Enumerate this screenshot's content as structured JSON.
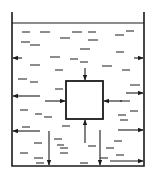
{
  "diagram": {
    "title": "Liquid pressure on a submerged cube and container walls",
    "colors": {
      "stroke": "#1a1a1a",
      "background": "#ffffff"
    },
    "container": {
      "left": 12,
      "right": 144,
      "top": 12,
      "bottom": 166
    },
    "water_surface_y": 23,
    "cube": {
      "x": 66,
      "y": 81,
      "w": 37,
      "h": 38
    },
    "arrows": [
      {
        "id": "cube-top",
        "x1": 85,
        "y1": 68,
        "x2": 85,
        "y2": 80
      },
      {
        "id": "cube-left",
        "x1": 45,
        "y1": 101,
        "x2": 65,
        "y2": 101
      },
      {
        "id": "cube-right",
        "x1": 122,
        "y1": 101,
        "x2": 104,
        "y2": 101
      },
      {
        "id": "cube-bottom",
        "x1": 85,
        "y1": 143,
        "x2": 85,
        "y2": 120
      },
      {
        "id": "left-wall-1",
        "x1": 22,
        "y1": 58,
        "x2": 13,
        "y2": 58
      },
      {
        "id": "right-wall-1",
        "x1": 134,
        "y1": 58,
        "x2": 143,
        "y2": 58
      },
      {
        "id": "left-wall-2",
        "x1": 40,
        "y1": 96,
        "x2": 13,
        "y2": 96
      },
      {
        "id": "right-wall-2",
        "x1": 126,
        "y1": 93,
        "x2": 143,
        "y2": 93
      },
      {
        "id": "left-wall-3",
        "x1": 40,
        "y1": 131,
        "x2": 13,
        "y2": 131
      },
      {
        "id": "right-wall-3",
        "x1": 118,
        "y1": 130,
        "x2": 143,
        "y2": 130
      },
      {
        "id": "right-wall-4",
        "x1": 110,
        "y1": 161,
        "x2": 143,
        "y2": 161
      },
      {
        "id": "bottom-1",
        "x1": 49,
        "y1": 131,
        "x2": 49,
        "y2": 165
      },
      {
        "id": "bottom-2",
        "x1": 100,
        "y1": 130,
        "x2": 100,
        "y2": 165
      }
    ],
    "dashes": [
      [
        22,
        32,
        30,
        32
      ],
      [
        40,
        32,
        50,
        32
      ],
      [
        72,
        32,
        82,
        32
      ],
      [
        88,
        32,
        96,
        32
      ],
      [
        115,
        35,
        124,
        35
      ],
      [
        126,
        31,
        134,
        31
      ],
      [
        21,
        42,
        30,
        42
      ],
      [
        30,
        45,
        40,
        45
      ],
      [
        60,
        38,
        70,
        38
      ],
      [
        88,
        40,
        98,
        40
      ],
      [
        80,
        49,
        90,
        49
      ],
      [
        116,
        52,
        124,
        52
      ],
      [
        50,
        57,
        60,
        57
      ],
      [
        70,
        59,
        78,
        59
      ],
      [
        80,
        62,
        88,
        62
      ],
      [
        30,
        65,
        40,
        65
      ],
      [
        55,
        70,
        63,
        70
      ],
      [
        102,
        66,
        112,
        66
      ],
      [
        122,
        70,
        130,
        70
      ],
      [
        18,
        79,
        27,
        79
      ],
      [
        30,
        82,
        38,
        82
      ],
      [
        55,
        89,
        63,
        89
      ],
      [
        130,
        85,
        140,
        85
      ],
      [
        120,
        101,
        130,
        101
      ],
      [
        20,
        110,
        28,
        110
      ],
      [
        35,
        114,
        42,
        114
      ],
      [
        44,
        117,
        52,
        117
      ],
      [
        118,
        115,
        126,
        115
      ],
      [
        130,
        111,
        138,
        111
      ],
      [
        22,
        127,
        30,
        127
      ],
      [
        62,
        126,
        70,
        126
      ],
      [
        120,
        120,
        128,
        120
      ],
      [
        34,
        143,
        42,
        143
      ],
      [
        54,
        139,
        62,
        139
      ],
      [
        57,
        145,
        64,
        145
      ],
      [
        114,
        141,
        122,
        141
      ],
      [
        34,
        158,
        43,
        158
      ],
      [
        60,
        148,
        68,
        148
      ],
      [
        20,
        153,
        28,
        153
      ],
      [
        60,
        153,
        68,
        153
      ],
      [
        88,
        146,
        96,
        146
      ],
      [
        106,
        148,
        114,
        148
      ],
      [
        116,
        155,
        124,
        155
      ],
      [
        100,
        158,
        108,
        158
      ],
      [
        80,
        163,
        88,
        163
      ],
      [
        36,
        163,
        44,
        163
      ]
    ]
  }
}
